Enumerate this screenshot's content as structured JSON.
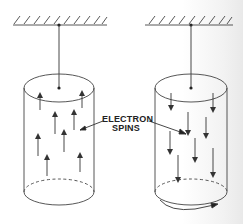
{
  "figure": {
    "label_line1": "ELECTRON",
    "label_line2": "SPINS",
    "panels": [
      {
        "name": "left",
        "spin_direction": "up",
        "rotating": false
      },
      {
        "name": "right",
        "spin_direction": "down",
        "rotating": true
      }
    ],
    "colors": {
      "ink": "#333333",
      "background": "#ffffff"
    }
  }
}
